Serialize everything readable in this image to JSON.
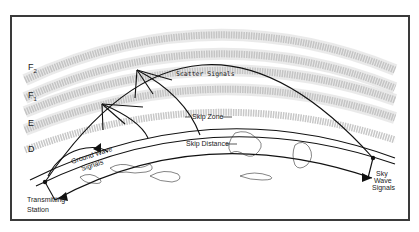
{
  "diagram": {
    "layers": [
      {
        "id": "F2",
        "label": "F",
        "subscript": "2"
      },
      {
        "id": "F1",
        "label": "F",
        "subscript": "1"
      },
      {
        "id": "E",
        "label": "E"
      },
      {
        "id": "D",
        "label": "D"
      }
    ],
    "labels": {
      "scatter": "Scatter Signals",
      "skip_zone": "Skip Zone",
      "skip_distance": "Skip Distance",
      "ground_wave_1": "Ground Wave",
      "ground_wave_2": "Signals",
      "transmitting_1": "Transmitting",
      "transmitting_2": "Station",
      "sky_1": "Sky",
      "sky_2": "Wave",
      "sky_3": "Signals"
    },
    "colors": {
      "line": "#111111",
      "layer_band": "#bdbdbd",
      "border": "#3a3a3a"
    }
  }
}
